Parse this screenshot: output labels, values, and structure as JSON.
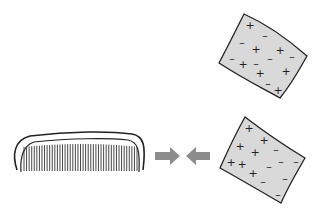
{
  "diagram": {
    "colors": {
      "background": "#ffffff",
      "sheet_fill": "#d9d9d9",
      "outline": "#222222",
      "arrow": "#8c8c8c",
      "comb_fill": "#ffffff"
    },
    "top_sheet": {
      "label": "sheet with mixed charges",
      "charges": [
        {
          "s": "+",
          "x": 250,
          "y": 25
        },
        {
          "s": "-",
          "x": 265,
          "y": 35
        },
        {
          "s": "-",
          "x": 242,
          "y": 42
        },
        {
          "s": "+",
          "x": 256,
          "y": 49
        },
        {
          "s": "+",
          "x": 280,
          "y": 50
        },
        {
          "s": "-",
          "x": 292,
          "y": 56
        },
        {
          "s": "-",
          "x": 232,
          "y": 58
        },
        {
          "s": "+",
          "x": 243,
          "y": 64
        },
        {
          "s": "-",
          "x": 256,
          "y": 63
        },
        {
          "s": "-",
          "x": 270,
          "y": 58
        },
        {
          "s": "+",
          "x": 260,
          "y": 73
        },
        {
          "s": "+",
          "x": 286,
          "y": 71
        },
        {
          "s": "-",
          "x": 268,
          "y": 83
        },
        {
          "s": "+",
          "x": 278,
          "y": 90
        }
      ]
    },
    "bottom_sheet": {
      "label": "sheet with separated charges",
      "charges": [
        {
          "s": "+",
          "x": 249,
          "y": 128
        },
        {
          "s": "+",
          "x": 264,
          "y": 140
        },
        {
          "s": "-",
          "x": 276,
          "y": 149
        },
        {
          "s": "+",
          "x": 240,
          "y": 146
        },
        {
          "s": "+",
          "x": 255,
          "y": 152
        },
        {
          "s": "-",
          "x": 281,
          "y": 161
        },
        {
          "s": "-",
          "x": 296,
          "y": 161
        },
        {
          "s": "+",
          "x": 231,
          "y": 162
        },
        {
          "s": "+",
          "x": 242,
          "y": 164
        },
        {
          "s": "-",
          "x": 269,
          "y": 166
        },
        {
          "s": "+",
          "x": 253,
          "y": 173
        },
        {
          "s": "-",
          "x": 285,
          "y": 178
        },
        {
          "s": "-",
          "x": 263,
          "y": 181
        },
        {
          "s": "-",
          "x": 278,
          "y": 194
        }
      ]
    },
    "arrows": [
      {
        "direction": "right",
        "label": "attraction arrow right"
      },
      {
        "direction": "left",
        "label": "attraction arrow left"
      }
    ],
    "comb": {
      "label": "comb",
      "teeth_count": 45
    }
  }
}
